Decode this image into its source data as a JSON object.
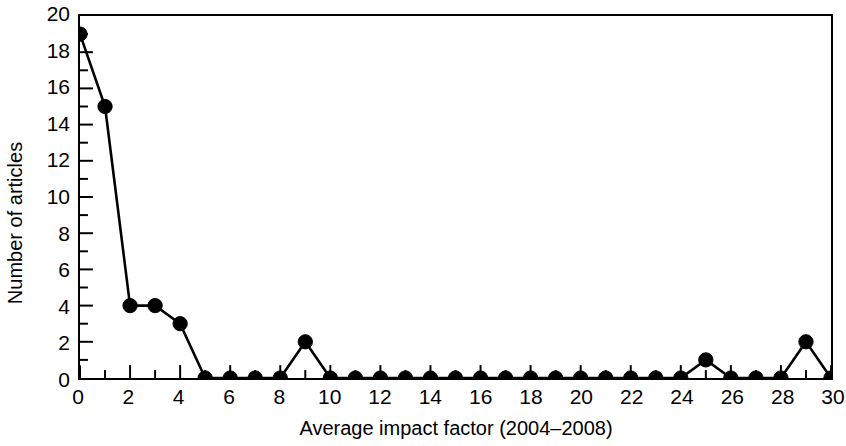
{
  "chart_data": {
    "type": "line",
    "title": "",
    "xlabel": "Average impact factor (2004–2008)",
    "ylabel": "Number of articles",
    "x": [
      0,
      1,
      2,
      3,
      4,
      5,
      6,
      7,
      8,
      9,
      10,
      11,
      12,
      13,
      14,
      15,
      16,
      17,
      18,
      19,
      20,
      21,
      22,
      23,
      24,
      25,
      26,
      27,
      28,
      29,
      30
    ],
    "values": [
      19,
      15,
      4,
      4,
      3,
      0,
      0,
      0,
      0,
      2,
      0,
      0,
      0,
      0,
      0,
      0,
      0,
      0,
      0,
      0,
      0,
      0,
      0,
      0,
      0,
      1,
      0,
      0,
      0,
      2,
      0
    ],
    "series": [
      {
        "name": "Number of articles",
        "values": [
          19,
          15,
          4,
          4,
          3,
          0,
          0,
          0,
          0,
          2,
          0,
          0,
          0,
          0,
          0,
          0,
          0,
          0,
          0,
          0,
          0,
          0,
          0,
          0,
          0,
          1,
          0,
          0,
          0,
          2,
          0
        ]
      }
    ],
    "xlim": [
      0,
      30
    ],
    "ylim": [
      0,
      20
    ],
    "xticks": [
      0,
      2,
      4,
      6,
      8,
      10,
      12,
      14,
      16,
      18,
      20,
      22,
      24,
      26,
      28,
      30
    ],
    "xtick_labels": [
      "0",
      "2",
      "4",
      "6",
      "8",
      "10",
      "12",
      "14",
      "16",
      "18",
      "20",
      "22",
      "24",
      "26",
      "28",
      "30"
    ],
    "xminor_ticks": [
      1,
      3,
      5,
      7,
      9,
      11,
      13,
      15,
      17,
      19,
      21,
      23,
      25,
      27,
      29
    ],
    "yticks": [
      0,
      2,
      4,
      6,
      8,
      10,
      12,
      14,
      16,
      18,
      20
    ],
    "ytick_labels": [
      "0",
      "2",
      "4",
      "6",
      "8",
      "10",
      "12",
      "14",
      "16",
      "18",
      "20"
    ],
    "yminor_ticks": [
      1,
      3,
      5,
      7,
      9,
      11,
      13,
      15,
      17,
      19
    ],
    "grid": false,
    "legend": null,
    "marker": "filled-circle",
    "line_color": "#000000",
    "marker_color": "#000000",
    "background_color": "#ffffff",
    "frame_color": "#000000"
  }
}
